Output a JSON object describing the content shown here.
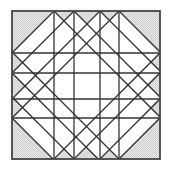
{
  "diagram": {
    "canvas": {
      "width": 169,
      "height": 170
    },
    "block": {
      "x": 12,
      "y": 11,
      "size": 148
    },
    "grid_lines_units": [
      42,
      62,
      88,
      107
    ],
    "diagonal_down_right_offsets": [
      42,
      62,
      88,
      107,
      -41,
      -62,
      -86,
      -107
    ],
    "diagonal_down_left_sums": [
      42,
      62,
      88,
      107,
      190,
      210,
      236,
      255
    ],
    "colors": {
      "line": "#333333",
      "shade": "#d6d6d6",
      "shade_dot": "#ffffff",
      "background": "#ffffff"
    },
    "shaded_regions": [
      {
        "name": "top-zigzag",
        "points": [
          [
            0,
            0
          ],
          [
            0,
            42
          ],
          [
            42,
            0
          ]
        ]
      },
      {
        "name": "top-x1-triangle",
        "points": [
          [
            42,
            0
          ],
          [
            52,
            10
          ],
          [
            62,
            0
          ]
        ]
      },
      {
        "name": "top-center-triangle",
        "points": [
          [
            62,
            0
          ],
          [
            75,
            13
          ],
          [
            88,
            0
          ]
        ]
      },
      {
        "name": "top-x2-triangle",
        "points": [
          [
            88,
            0
          ],
          [
            97.5,
            9.5
          ],
          [
            107,
            0
          ]
        ]
      },
      {
        "name": "top-right-corner",
        "points": [
          [
            107,
            0
          ],
          [
            148,
            0
          ],
          [
            148,
            41
          ]
        ]
      },
      {
        "name": "right-x1-triangle",
        "points": [
          [
            148,
            41
          ],
          [
            138,
            51
          ],
          [
            148,
            60
          ]
        ]
      },
      {
        "name": "right-center-triangle",
        "points": [
          [
            148,
            60
          ],
          [
            135,
            73
          ],
          [
            148,
            86
          ]
        ]
      },
      {
        "name": "right-x2-triangle",
        "points": [
          [
            148,
            86
          ],
          [
            138,
            96
          ],
          [
            148,
            106
          ]
        ]
      },
      {
        "name": "bottom-right-corner",
        "points": [
          [
            148,
            106
          ],
          [
            148,
            148
          ],
          [
            106,
            148
          ]
        ]
      },
      {
        "name": "bottom-x2-triangle",
        "points": [
          [
            106,
            148
          ],
          [
            97,
            138
          ],
          [
            88,
            148
          ]
        ]
      },
      {
        "name": "bottom-center-triangle",
        "points": [
          [
            88,
            148
          ],
          [
            75,
            135
          ],
          [
            62,
            148
          ]
        ]
      },
      {
        "name": "bottom-x1-triangle",
        "points": [
          [
            62,
            148
          ],
          [
            52,
            138
          ],
          [
            42,
            148
          ]
        ]
      },
      {
        "name": "bottom-left-corner",
        "points": [
          [
            41,
            148
          ],
          [
            0,
            148
          ],
          [
            0,
            107
          ]
        ]
      },
      {
        "name": "left-x2-triangle",
        "points": [
          [
            0,
            107
          ],
          [
            10,
            97
          ],
          [
            0,
            86
          ]
        ]
      },
      {
        "name": "left-center-triangle",
        "points": [
          [
            0,
            86
          ],
          [
            13,
            74
          ],
          [
            0,
            62
          ]
        ]
      },
      {
        "name": "left-x1-triangle",
        "points": [
          [
            0,
            62
          ],
          [
            10,
            52
          ],
          [
            0,
            42
          ]
        ]
      }
    ]
  }
}
